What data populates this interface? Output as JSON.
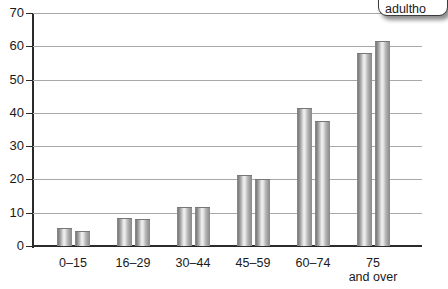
{
  "chart_data": {
    "type": "bar",
    "title": "",
    "subtitle": "",
    "xlabel": "",
    "ylabel": "",
    "categories": [
      "0–15",
      "16–29",
      "30–44",
      "45–59",
      "60–74",
      "75\nand over"
    ],
    "category_labels": [
      {
        "line1": "0–15",
        "line2": ""
      },
      {
        "line1": "16–29",
        "line2": ""
      },
      {
        "line1": "30–44",
        "line2": ""
      },
      {
        "line1": "45–59",
        "line2": ""
      },
      {
        "line1": "60–74",
        "line2": ""
      },
      {
        "line1": "75",
        "line2": "and over"
      }
    ],
    "series": [
      {
        "name": "series-1",
        "values": [
          5.3,
          8.5,
          11.8,
          21.2,
          41.5,
          58.0
        ]
      },
      {
        "name": "series-2",
        "values": [
          4.6,
          8.0,
          11.7,
          20.2,
          37.5,
          61.5
        ]
      }
    ],
    "ylim": [
      0,
      70
    ],
    "ytick_labels": [
      "0",
      "10",
      "20",
      "30",
      "40",
      "50",
      "60",
      "70"
    ],
    "ytick_values": [
      0,
      10,
      20,
      30,
      40,
      50,
      60,
      70
    ],
    "grid": true,
    "legend": "none",
    "colors": {
      "bar_light": "#f2f2f2",
      "bar_mid": "#b5b5b5",
      "bar_dark": "#7d7d7d",
      "gridline": "#a8a8a8",
      "axis": "#2b2b2b",
      "text": "#1a1a1a"
    }
  },
  "callout": {
    "text": "adultho"
  }
}
